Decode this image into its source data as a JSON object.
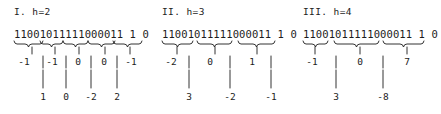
{
  "figure": {
    "type": "diagram",
    "bitstring": "11001011111000011 1 0",
    "ink_color": "#1c1c1c",
    "background_color": "#ffffff"
  },
  "panels": [
    {
      "title": "I. h=2",
      "h": 2,
      "bits": "11001011111000011 1 0",
      "tier1_values": [
        "-1",
        "-1",
        "0",
        "0",
        "-1"
      ],
      "tier2_values": [
        "1",
        "0",
        "-2",
        "2"
      ]
    },
    {
      "title": "II. h=3",
      "h": 3,
      "bits": "11001011111000011 1 0",
      "tier1_values": [
        "-2",
        "0",
        "1"
      ],
      "tier2_values": [
        "3",
        "-2",
        "-1"
      ]
    },
    {
      "title": "III. h=4",
      "h": 4,
      "bits": "11001011111000011 1 0",
      "tier1_values": [
        "-1",
        "0",
        "7"
      ],
      "tier2_values": [
        "3",
        "-8"
      ]
    }
  ]
}
